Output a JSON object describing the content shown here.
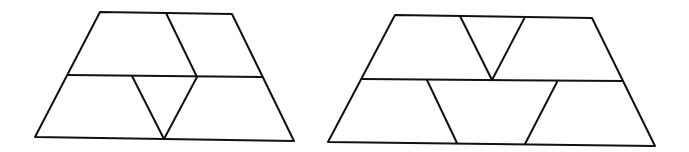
{
  "diagram": {
    "stroke_color": "#111111",
    "background": "#ffffff",
    "figures": [
      {
        "id": "left-trapezoid",
        "outline": [
          [
            100,
            12
          ],
          [
            232,
            14
          ],
          [
            294,
            141
          ],
          [
            35,
            137
          ]
        ],
        "segments": [
          [
            [
              68,
              75
            ],
            [
              262,
              77
            ]
          ],
          [
            [
              166,
              13
            ],
            [
              197,
              77
            ]
          ],
          [
            [
              132,
              76
            ],
            [
              164,
              139
            ]
          ],
          [
            [
              164,
              139
            ],
            [
              197,
              77
            ]
          ]
        ]
      },
      {
        "id": "right-trapezoid",
        "outline": [
          [
            395,
            15
          ],
          [
            592,
            18
          ],
          [
            655,
            146
          ],
          [
            328,
            142
          ]
        ],
        "segments": [
          [
            [
              362,
              79
            ],
            [
              623,
              81
            ]
          ],
          [
            [
              460,
              16
            ],
            [
              492,
              80
            ]
          ],
          [
            [
              492,
              80
            ],
            [
              525,
              17
            ]
          ],
          [
            [
              427,
              80
            ],
            [
              457,
              143
            ]
          ],
          [
            [
              557,
              82
            ],
            [
              525,
              144
            ]
          ]
        ]
      }
    ]
  }
}
